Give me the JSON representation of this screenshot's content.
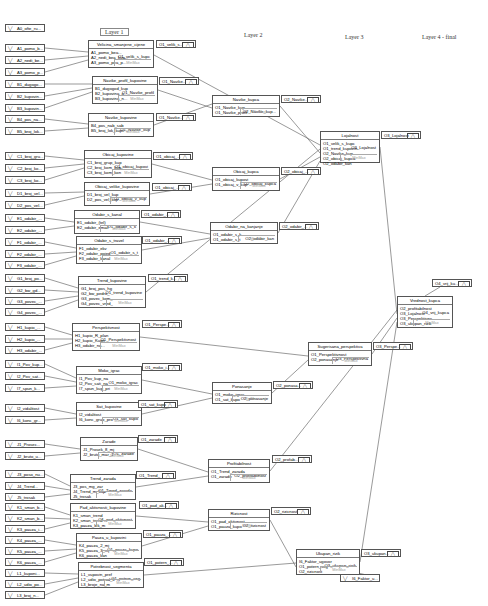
{
  "layers": [
    {
      "label": "Layer 1",
      "x": 100,
      "y": 28,
      "boxed": true
    },
    {
      "label": "Layer 2",
      "x": 244,
      "y": 32,
      "boxed": false
    },
    {
      "label": "Layer 3",
      "x": 345,
      "y": 34,
      "boxed": false
    },
    {
      "label": "Layer 4 - final",
      "x": 422,
      "y": 34,
      "boxed": false
    }
  ],
  "function_label": "MinMax",
  "inputs": [
    {
      "label": "A0_ofte_ru...",
      "x": 5,
      "y": 24
    },
    {
      "label": "A1_pomo_b...",
      "x": 5,
      "y": 44
    },
    {
      "label": "A2_nedi_be...",
      "x": 5,
      "y": 56
    },
    {
      "label": "A3_pomo_p...",
      "x": 5,
      "y": 68
    },
    {
      "label": "B1_dugogo...",
      "x": 5,
      "y": 80
    },
    {
      "label": "B2_kupovin...",
      "x": 5,
      "y": 92
    },
    {
      "label": "B3_kupovin...",
      "x": 5,
      "y": 104
    },
    {
      "label": "B4_pos_na...",
      "x": 5,
      "y": 115
    },
    {
      "label": "B5_broj_lok...",
      "x": 5,
      "y": 127
    },
    {
      "label": "C1_broj_gru...",
      "x": 5,
      "y": 152
    },
    {
      "label": "C2_broj_ko...",
      "x": 5,
      "y": 164
    },
    {
      "label": "C3_broj_ko...",
      "x": 5,
      "y": 176
    },
    {
      "label": "D1_broj_vel...",
      "x": 5,
      "y": 189
    },
    {
      "label": "D2_pos_vel...",
      "x": 5,
      "y": 201
    },
    {
      "label": "E1_odabir_...",
      "x": 5,
      "y": 214
    },
    {
      "label": "E2_odabir_...",
      "x": 5,
      "y": 226
    },
    {
      "label": "F1_odabir_...",
      "x": 5,
      "y": 238
    },
    {
      "label": "F2_odabir_...",
      "x": 5,
      "y": 250
    },
    {
      "label": "F3_odabir_...",
      "x": 5,
      "y": 261
    },
    {
      "label": "G1_broj_po...",
      "x": 5,
      "y": 274
    },
    {
      "label": "G2_bw_gd...",
      "x": 5,
      "y": 286
    },
    {
      "label": "G3_povec_...",
      "x": 5,
      "y": 297
    },
    {
      "label": "G4_povec_...",
      "x": 5,
      "y": 308
    },
    {
      "label": "H1_kupio_...",
      "x": 5,
      "y": 323
    },
    {
      "label": "H2_kupio_...",
      "x": 5,
      "y": 335
    },
    {
      "label": "H3_odabir_...",
      "x": 5,
      "y": 346
    },
    {
      "label": "I1_Pov_kup...",
      "x": 5,
      "y": 360
    },
    {
      "label": "I2_Pov_sat...",
      "x": 5,
      "y": 372
    },
    {
      "label": "I7_spun_k...",
      "x": 5,
      "y": 384
    },
    {
      "label": "I2_vidalitost",
      "x": 5,
      "y": 404
    },
    {
      "label": "I6_konc_gr...",
      "x": 5,
      "y": 416
    },
    {
      "label": "J1_Prosec...",
      "x": 5,
      "y": 440
    },
    {
      "label": "J2_bruto_u...",
      "x": 5,
      "y": 452
    },
    {
      "label": "J3_poso_nu...",
      "x": 5,
      "y": 470
    },
    {
      "label": "J4_Trend...",
      "x": 5,
      "y": 482
    },
    {
      "label": "J5_trosak",
      "x": 5,
      "y": 493
    },
    {
      "label": "K1_sman_b...",
      "x": 5,
      "y": 503
    },
    {
      "label": "K2_sman_b...",
      "x": 5,
      "y": 514
    },
    {
      "label": "K3_pauza_i...",
      "x": 5,
      "y": 525
    },
    {
      "label": "K4_pauza_...",
      "x": 5,
      "y": 536
    },
    {
      "label": "K5_pauza_...",
      "x": 5,
      "y": 547
    },
    {
      "label": "K6_pauza_...",
      "x": 5,
      "y": 558
    },
    {
      "label": "L1_kuponi...",
      "x": 5,
      "y": 569
    },
    {
      "label": "L2_udio_po...",
      "x": 5,
      "y": 580
    },
    {
      "label": "L3_broj_n...",
      "x": 5,
      "y": 591
    },
    {
      "label": "I6_Faktor_u...",
      "x": 340,
      "y": 574
    }
  ],
  "nodes": [
    {
      "title": "Velicina_smanjene_cijene",
      "x": 88,
      "y": 40,
      "w": 66,
      "h": 28,
      "ins": [
        "A1_pomo_bea...",
        "A2_nedi_bea_kup...",
        "A3_pomo_pea_p..."
      ],
      "out": "O1_velik_s_kupc"
    },
    {
      "title": "Navike_profil_kupovine",
      "x": 92,
      "y": 76,
      "w": 66,
      "h": 28,
      "ins": [
        "B1_dugogod_kup",
        "B2_kupovina_a...",
        "B3_kupovina_n..."
      ],
      "out": "O1_Navike_profil"
    },
    {
      "title": "Navike_kupovine",
      "x": 88,
      "y": 113,
      "w": 66,
      "h": 24,
      "ins": [
        "B4_pos_nab_sab",
        "B5_broj_lok_kupc"
      ],
      "out": "O1_Navike_kup"
    },
    {
      "title": "Obicaj_kupovine",
      "x": 84,
      "y": 150,
      "w": 68,
      "h": 28,
      "ins": [
        "C1_broj_grup_kup",
        "C2_broj_kom_kup",
        "C3_broj_kom_kon"
      ],
      "out": "O1_obicaj_kupovi"
    },
    {
      "title": "Obicaj_velike_kupovine",
      "x": 84,
      "y": 182,
      "w": 66,
      "h": 24,
      "ins": [
        "D1_broj_vel_kup",
        "D2_pos_vel_kup"
      ],
      "out": "O1_obicaj_v_kup"
    },
    {
      "title": "Odabir_s_kanal",
      "x": 74,
      "y": 210,
      "w": 66,
      "h": 24,
      "ins": [
        "E1_odabir_(tel)",
        "E2_odabir_email"
      ],
      "out": "O1_odabir_s_k"
    },
    {
      "title": "Odabir_s_travel",
      "x": 76,
      "y": 236,
      "w": 66,
      "h": 28,
      "ins": [
        "F1_odabir_ekv",
        "F2_odabir_pojed",
        "F3_odabir_kanal"
      ],
      "out": "O1_odabir_s_t"
    },
    {
      "title": "Trend_kupovine",
      "x": 78,
      "y": 276,
      "w": 68,
      "h": 32,
      "ins": [
        "G1_broj_pos_hg",
        "G2_bw_pedro_",
        "G3_povec_kom_",
        "G4_povec_vred_"
      ],
      "out": "O1_trend_kupovine"
    },
    {
      "title": "Perspektivnost",
      "x": 72,
      "y": 323,
      "w": 68,
      "h": 28,
      "ins": [
        "H1_kupio_R_plan",
        "H2_kupio_Kupn",
        "H3_odabir_na..."
      ],
      "out": "O1_Perspektivnost"
    },
    {
      "title": "Moko_igrac",
      "x": 76,
      "y": 366,
      "w": 66,
      "h": 28,
      "ins": [
        "I1_Pov_kup_na",
        "I2_Pov_sati_na",
        "I7_spun_kup_pri"
      ],
      "out": "O1_moko_igrac"
    },
    {
      "title": "Sat_kupovine",
      "x": 76,
      "y": 402,
      "w": 66,
      "h": 24,
      "ins": [
        "I2_vidalitost",
        "I6_konc_grup_pro"
      ],
      "out": "O1_sat_kupo"
    },
    {
      "title": "Zarade",
      "x": 80,
      "y": 437,
      "w": 58,
      "h": 24,
      "ins": [
        "J1_Prosek_8_mj",
        "J2_bruto_mar_1"
      ],
      "out": "O1_zarade"
    },
    {
      "title": "Trend_zarada",
      "x": 70,
      "y": 474,
      "w": 66,
      "h": 26,
      "ins": [
        "J3_pos_mg_zar",
        "J4_Trend_m_kup",
        "J5_trosak"
      ],
      "out": "O1_Trend_zarada"
    },
    {
      "title": "Pad_aktivnosti_kupovine",
      "x": 70,
      "y": 503,
      "w": 66,
      "h": 26,
      "ins": [
        "K1_sman_trend",
        "K2_sman_trend",
        "K3_pauza_lek_m"
      ],
      "out": "O1_pad_aktivnost"
    },
    {
      "title": "Pauza_u_kupovini",
      "x": 76,
      "y": 533,
      "w": 66,
      "h": 26,
      "ins": [
        "K4_pauza_2_mj",
        "K5_pauza_3_mj",
        "K6_pauza_kan"
      ],
      "out": "O1_pauza_kupo"
    },
    {
      "title": "Potrebnost_segmenta",
      "x": 78,
      "y": 562,
      "w": 66,
      "h": 26,
      "ins": [
        "L1_vupovin_pref",
        "L2_udio_potrod_k",
        "L3_broje_na_m"
      ],
      "out": "O1_potern_seg"
    },
    {
      "title": "Navike_kupca",
      "x": 212,
      "y": 95,
      "w": 68,
      "h": 22,
      "ins": [
        "O1_Navike_kup",
        "O1_Navike_profil"
      ],
      "out": "O2_Navike_kup..."
    },
    {
      "title": "Obicaj_kupca",
      "x": 212,
      "y": 167,
      "w": 68,
      "h": 24,
      "ins": [
        "O1_obicaj_kupovi",
        "O1_obicaj_v_kup"
      ],
      "out": "O2_obicaj_kupca"
    },
    {
      "title": "Odabir_na_kanjanje",
      "x": 210,
      "y": 222,
      "w": 68,
      "h": 22,
      "ins": [
        "O1_odabir_s_k...",
        "O1_odabir_s_t"
      ],
      "out": "O2_odabir_kan"
    },
    {
      "title": "Ponasanje",
      "x": 212,
      "y": 382,
      "w": 60,
      "h": 22,
      "ins": [
        "O1_moko_igrac",
        "O1_sat_kupo"
      ],
      "out": "O2_ponasanje"
    },
    {
      "title": "Profitabilnost",
      "x": 208,
      "y": 459,
      "w": 62,
      "h": 24,
      "ins": [
        "O1_Trend_zarada",
        "O1_zarade"
      ],
      "out": "O2_profitabilnost"
    },
    {
      "title": "Rizicnost",
      "x": 208,
      "y": 509,
      "w": 62,
      "h": 22,
      "ins": [
        "O1_pad_aktivnost",
        "O1_pauza_kupo"
      ],
      "out": "O2_rizicnost"
    },
    {
      "title": "Lojalnost",
      "x": 320,
      "y": 131,
      "w": 60,
      "h": 32,
      "ins": [
        "O1_velik_s_kupc",
        "O1_trend_kupovin",
        "O2_Navike_kup...",
        "O2_obicaj_kupca",
        "O2_odabir_kan"
      ],
      "out": "O3_Lojalnost"
    },
    {
      "title": "Sugerisana_perspektiva",
      "x": 308,
      "y": 342,
      "w": 64,
      "h": 24,
      "ins": [
        "O1_Perspektivnost",
        "O2_ponasanje"
      ],
      "out": "O3_Perspektivna"
    },
    {
      "title": "Ukupan_rizik",
      "x": 296,
      "y": 549,
      "w": 64,
      "h": 26,
      "ins": [
        "I6_Faktor_ugovor",
        "O1_potern_seg",
        "O2_rizicnost"
      ],
      "out": "O3_ukupan_rizik"
    },
    {
      "title": "Vrednost_kupca",
      "x": 397,
      "y": 296,
      "w": 56,
      "h": 32,
      "ins": [
        "O2_profitabilnost",
        "O3_Lojalnost",
        "O3_Perspektivna",
        "O3_ukupan_rizik"
      ],
      "out": "O4_vrij_kupca"
    }
  ],
  "outboxes": [
    {
      "label": "O1_velik_s...",
      "x": 156,
      "y": 40
    },
    {
      "label": "O1_Navike...",
      "x": 159,
      "y": 77
    },
    {
      "label": "O1_Navike...",
      "x": 156,
      "y": 113
    },
    {
      "label": "O1_obicaj_...",
      "x": 153,
      "y": 152
    },
    {
      "label": "O1_obicaj_...",
      "x": 152,
      "y": 183
    },
    {
      "label": "O1_odabir_...",
      "x": 141,
      "y": 210
    },
    {
      "label": "O1_odabir_...",
      "x": 142,
      "y": 236
    },
    {
      "label": "O1_trend_k...",
      "x": 148,
      "y": 274
    },
    {
      "label": "O1_Perspe...",
      "x": 142,
      "y": 320
    },
    {
      "label": "O1_moko_i...",
      "x": 142,
      "y": 363
    },
    {
      "label": "O1_sat_kupo",
      "x": 138,
      "y": 400
    },
    {
      "label": "O1_zarade",
      "x": 138,
      "y": 435
    },
    {
      "label": "O1_Trend_",
      "x": 136,
      "y": 471
    },
    {
      "label": "O1_pad_ak...",
      "x": 139,
      "y": 501
    },
    {
      "label": "O1_pauza_...",
      "x": 143,
      "y": 530
    },
    {
      "label": "O1_potern_...",
      "x": 144,
      "y": 558
    },
    {
      "label": "O2_Navike...",
      "x": 281,
      "y": 95
    },
    {
      "label": "O2_obicaj_...",
      "x": 281,
      "y": 167
    },
    {
      "label": "O2_odabir_...",
      "x": 279,
      "y": 222
    },
    {
      "label": "O2_ponasa...",
      "x": 273,
      "y": 381
    },
    {
      "label": "O2_profab...",
      "x": 272,
      "y": 455
    },
    {
      "label": "O2_rizicnost",
      "x": 271,
      "y": 507
    },
    {
      "label": "O3_Lojalnost",
      "x": 381,
      "y": 131
    },
    {
      "label": "O3_Perspe...",
      "x": 373,
      "y": 342
    },
    {
      "label": "O3_ukupan...",
      "x": 361,
      "y": 549
    },
    {
      "label": "O4_vrij_ku...",
      "x": 432,
      "y": 279
    }
  ],
  "wires": [
    [
      45,
      48,
      88,
      52
    ],
    [
      45,
      60,
      88,
      56
    ],
    [
      45,
      72,
      88,
      60
    ],
    [
      45,
      84,
      92,
      84
    ],
    [
      45,
      96,
      92,
      88
    ],
    [
      45,
      108,
      92,
      92
    ],
    [
      45,
      119,
      88,
      124
    ],
    [
      45,
      131,
      88,
      128
    ],
    [
      45,
      156,
      84,
      160
    ],
    [
      45,
      168,
      84,
      164
    ],
    [
      45,
      180,
      84,
      168
    ],
    [
      45,
      193,
      84,
      192
    ],
    [
      45,
      205,
      84,
      196
    ],
    [
      45,
      218,
      74,
      222
    ],
    [
      45,
      230,
      74,
      226
    ],
    [
      45,
      242,
      76,
      248
    ],
    [
      45,
      254,
      76,
      252
    ],
    [
      45,
      265,
      76,
      256
    ],
    [
      45,
      278,
      78,
      288
    ],
    [
      45,
      290,
      78,
      292
    ],
    [
      45,
      301,
      78,
      296
    ],
    [
      45,
      312,
      78,
      300
    ],
    [
      45,
      327,
      72,
      335
    ],
    [
      45,
      339,
      72,
      339
    ],
    [
      45,
      350,
      72,
      343
    ],
    [
      45,
      364,
      76,
      378
    ],
    [
      45,
      376,
      76,
      382
    ],
    [
      45,
      388,
      76,
      386
    ],
    [
      45,
      408,
      76,
      414
    ],
    [
      45,
      420,
      76,
      418
    ],
    [
      45,
      444,
      80,
      449
    ],
    [
      45,
      456,
      80,
      453
    ],
    [
      45,
      474,
      70,
      486
    ],
    [
      45,
      486,
      70,
      490
    ],
    [
      45,
      497,
      70,
      494
    ],
    [
      45,
      507,
      70,
      515
    ],
    [
      45,
      518,
      70,
      519
    ],
    [
      45,
      529,
      70,
      523
    ],
    [
      45,
      540,
      76,
      545
    ],
    [
      45,
      551,
      76,
      549
    ],
    [
      45,
      562,
      76,
      553
    ],
    [
      45,
      573,
      78,
      574
    ],
    [
      45,
      584,
      78,
      578
    ],
    [
      45,
      595,
      78,
      582
    ],
    [
      154,
      55,
      320,
      145
    ],
    [
      158,
      90,
      212,
      108
    ],
    [
      154,
      125,
      212,
      104
    ],
    [
      152,
      164,
      212,
      180
    ],
    [
      150,
      194,
      212,
      184
    ],
    [
      140,
      222,
      210,
      234
    ],
    [
      142,
      250,
      210,
      238
    ],
    [
      146,
      292,
      320,
      149
    ],
    [
      140,
      337,
      308,
      356
    ],
    [
      142,
      380,
      212,
      394
    ],
    [
      142,
      414,
      212,
      398
    ],
    [
      138,
      449,
      208,
      472
    ],
    [
      136,
      487,
      208,
      476
    ],
    [
      136,
      516,
      208,
      522
    ],
    [
      142,
      546,
      208,
      526
    ],
    [
      144,
      575,
      296,
      563
    ],
    [
      380,
      578,
      296,
      559
    ],
    [
      280,
      106,
      320,
      153
    ],
    [
      280,
      179,
      320,
      157
    ],
    [
      278,
      233,
      320,
      161
    ],
    [
      272,
      393,
      308,
      360
    ],
    [
      270,
      471,
      397,
      310
    ],
    [
      270,
      520,
      296,
      567
    ],
    [
      372,
      354,
      397,
      318
    ],
    [
      380,
      147,
      397,
      314
    ],
    [
      360,
      562,
      397,
      322
    ],
    [
      425,
      296,
      440,
      287
    ]
  ]
}
